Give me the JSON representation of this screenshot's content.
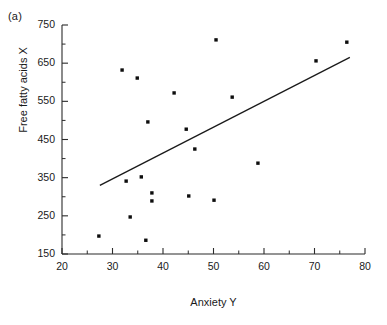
{
  "figure": {
    "panel_label": "(a)"
  },
  "chart_data": {
    "type": "scatter",
    "title": "",
    "subtitle": "",
    "xlabel": "Anxiety Y",
    "ylabel": "Free fatty acids X",
    "xlim": [
      20,
      80
    ],
    "ylim": [
      150,
      750
    ],
    "xticks": [
      20,
      30,
      40,
      50,
      60,
      70,
      80
    ],
    "xtick_labels": [
      "20",
      "30",
      "40",
      "50",
      "60",
      "70",
      "80"
    ],
    "yticks": [
      150,
      250,
      350,
      450,
      550,
      650,
      750
    ],
    "ytick_labels": [
      "150",
      "250",
      "350",
      "450",
      "550",
      "650",
      "750"
    ],
    "x_minor_tick_step": 5,
    "y_minor_tick_step": 50,
    "grid": false,
    "legend": null,
    "marker": "filled-square",
    "marker_color": "#0d0d0d",
    "points": [
      {
        "x": 27.3,
        "y": 197
      },
      {
        "x": 31.9,
        "y": 632
      },
      {
        "x": 33.5,
        "y": 247
      },
      {
        "x": 32.7,
        "y": 341
      },
      {
        "x": 34.9,
        "y": 611
      },
      {
        "x": 35.7,
        "y": 352
      },
      {
        "x": 36.6,
        "y": 186
      },
      {
        "x": 37.0,
        "y": 496
      },
      {
        "x": 37.8,
        "y": 310
      },
      {
        "x": 37.8,
        "y": 289
      },
      {
        "x": 42.2,
        "y": 572
      },
      {
        "x": 44.6,
        "y": 477
      },
      {
        "x": 45.1,
        "y": 302
      },
      {
        "x": 46.3,
        "y": 425
      },
      {
        "x": 50.1,
        "y": 291
      },
      {
        "x": 50.5,
        "y": 711
      },
      {
        "x": 53.7,
        "y": 561
      },
      {
        "x": 58.8,
        "y": 388
      },
      {
        "x": 70.3,
        "y": 656
      },
      {
        "x": 76.4,
        "y": 705
      }
    ],
    "trend_line": {
      "type": "linear-fit",
      "x_start": 27.5,
      "y_start": 330,
      "x_end": 77.0,
      "y_end": 665
    }
  }
}
